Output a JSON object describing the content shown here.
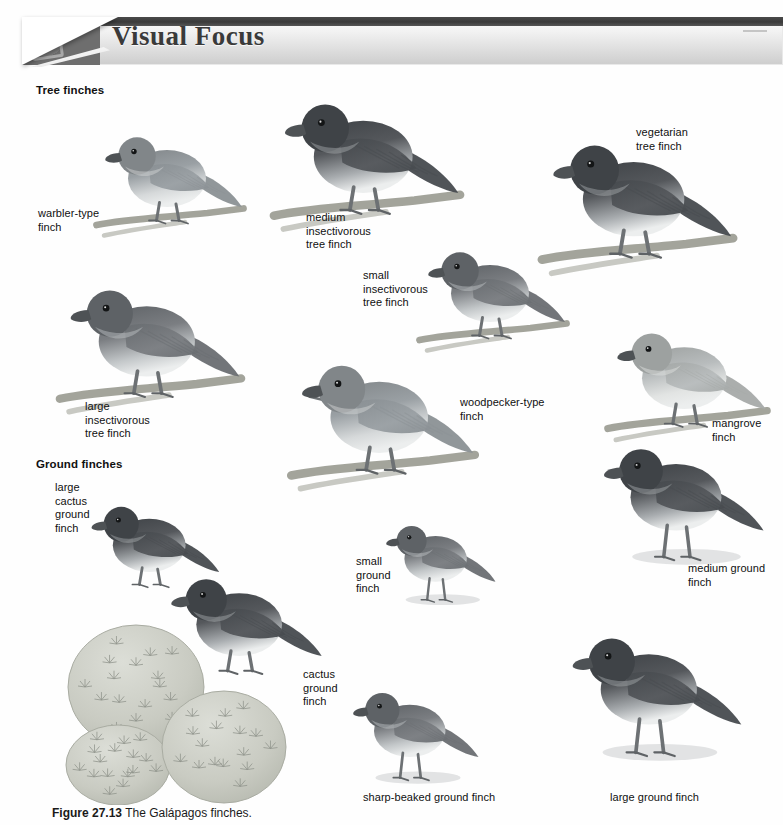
{
  "header": {
    "title": "Visual Focus",
    "corner_icon": "page-curl-photo"
  },
  "groups": [
    {
      "id": "tree",
      "label": "Tree finches"
    },
    {
      "id": "ground",
      "label": "Ground finches"
    }
  ],
  "labels": [
    {
      "id": "warbler-type-finch",
      "text": "warbler-type\nfinch",
      "x": 38,
      "y": 207
    },
    {
      "id": "medium-insectivorous",
      "text": "medium\ninsectivorous\ntree finch",
      "x": 306,
      "y": 211
    },
    {
      "id": "small-insectivorous",
      "text": "small\ninsectivorous\ntree finch",
      "x": 363,
      "y": 269
    },
    {
      "id": "vegetarian-tree-finch",
      "text": "vegetarian\ntree finch",
      "x": 636,
      "y": 126
    },
    {
      "id": "large-insectivorous",
      "text": "large\ninsectivorous\ntree finch",
      "x": 85,
      "y": 400
    },
    {
      "id": "woodpecker-type-finch",
      "text": "woodpecker-type\nfinch",
      "x": 460,
      "y": 396
    },
    {
      "id": "mangrove-finch",
      "text": "mangrove\nfinch",
      "x": 712,
      "y": 417
    },
    {
      "id": "large-cactus-ground-finch",
      "text": "large\ncactus\nground\nfinch",
      "x": 55,
      "y": 481
    },
    {
      "id": "small-ground-finch",
      "text": "small\nground\nfinch",
      "x": 356,
      "y": 555
    },
    {
      "id": "medium-ground-finch",
      "text": "medium ground\nfinch",
      "x": 688,
      "y": 562
    },
    {
      "id": "cactus-ground-finch",
      "text": "cactus\nground\nfinch",
      "x": 303,
      "y": 668
    },
    {
      "id": "sharp-beaked-ground-finch",
      "text": "sharp-beaked ground finch",
      "x": 363,
      "y": 791
    },
    {
      "id": "large-ground-finch",
      "text": "large ground finch",
      "x": 610,
      "y": 791
    }
  ],
  "caption": {
    "figure_number": "Figure 27.13",
    "text": "The Galápagos finches."
  },
  "birds": [
    {
      "id": "warbler-type-finch",
      "x": 95,
      "y": 118,
      "w": 150,
      "h": 130,
      "tone": "light",
      "pose": "perched",
      "flip": false
    },
    {
      "id": "medium-insectivorous-tree-finch",
      "x": 272,
      "y": 80,
      "w": 190,
      "h": 165,
      "tone": "dark",
      "pose": "perched",
      "flip": false
    },
    {
      "id": "small-insectivorous-tree-finch",
      "x": 418,
      "y": 238,
      "w": 150,
      "h": 120,
      "tone": "medium",
      "pose": "perched",
      "flip": false
    },
    {
      "id": "vegetarian-tree-finch",
      "x": 540,
      "y": 125,
      "w": 195,
      "h": 160,
      "tone": "dark",
      "pose": "perched",
      "flip": false
    },
    {
      "id": "large-insectivorous-tree-finch",
      "x": 58,
      "y": 272,
      "w": 185,
      "h": 150,
      "tone": "medium",
      "pose": "perched",
      "flip": false
    },
    {
      "id": "woodpecker-type-finch",
      "x": 288,
      "y": 348,
      "w": 190,
      "h": 150,
      "tone": "light",
      "pose": "perched-twig",
      "flip": false
    },
    {
      "id": "mangrove-finch",
      "x": 600,
      "y": 318,
      "w": 175,
      "h": 130,
      "tone": "pale",
      "pose": "perched",
      "flip": false
    },
    {
      "id": "large-cactus-ground-finch",
      "x": 82,
      "y": 462,
      "w": 140,
      "h": 175,
      "tone": "dark",
      "pose": "standing",
      "flip": false
    },
    {
      "id": "cactus-ground-finch",
      "x": 160,
      "y": 557,
      "w": 165,
      "h": 145,
      "tone": "dark",
      "pose": "standing",
      "flip": false
    },
    {
      "id": "small-ground-finch",
      "x": 378,
      "y": 505,
      "w": 120,
      "h": 115,
      "tone": "medium",
      "pose": "ground",
      "flip": false
    },
    {
      "id": "medium-ground-finch",
      "x": 592,
      "y": 420,
      "w": 175,
      "h": 165,
      "tone": "dark",
      "pose": "ground",
      "flip": false
    },
    {
      "id": "sharp-beaked-ground-finch",
      "x": 320,
      "y": 680,
      "w": 185,
      "h": 110,
      "tone": "medium",
      "pose": "ground",
      "flip": false
    },
    {
      "id": "large-ground-finch",
      "x": 560,
      "y": 605,
      "w": 185,
      "h": 180,
      "tone": "dark",
      "pose": "ground",
      "flip": false
    }
  ],
  "cactus_cluster": {
    "id": "prickly-pear-cactus-pads",
    "x": 58,
    "y": 615,
    "w": 245,
    "h": 190,
    "pads": 3
  },
  "colors": {
    "page_background": "#ffffff",
    "banner_dark": "#3f3f3f",
    "banner_gradient_top": "#ffffff",
    "banner_gradient_bottom": "#cdcdcd",
    "title_text": "#3a3a3a",
    "label_text": "#101010",
    "bird_dark": "#55585c",
    "bird_medium": "#7b7e82",
    "bird_light": "#9aa0a4",
    "bird_pale": "#b8bcbd",
    "branch": "#9b9c92",
    "cactus_fill": "#c9cbc2",
    "shadow": "#d2d4d6"
  }
}
